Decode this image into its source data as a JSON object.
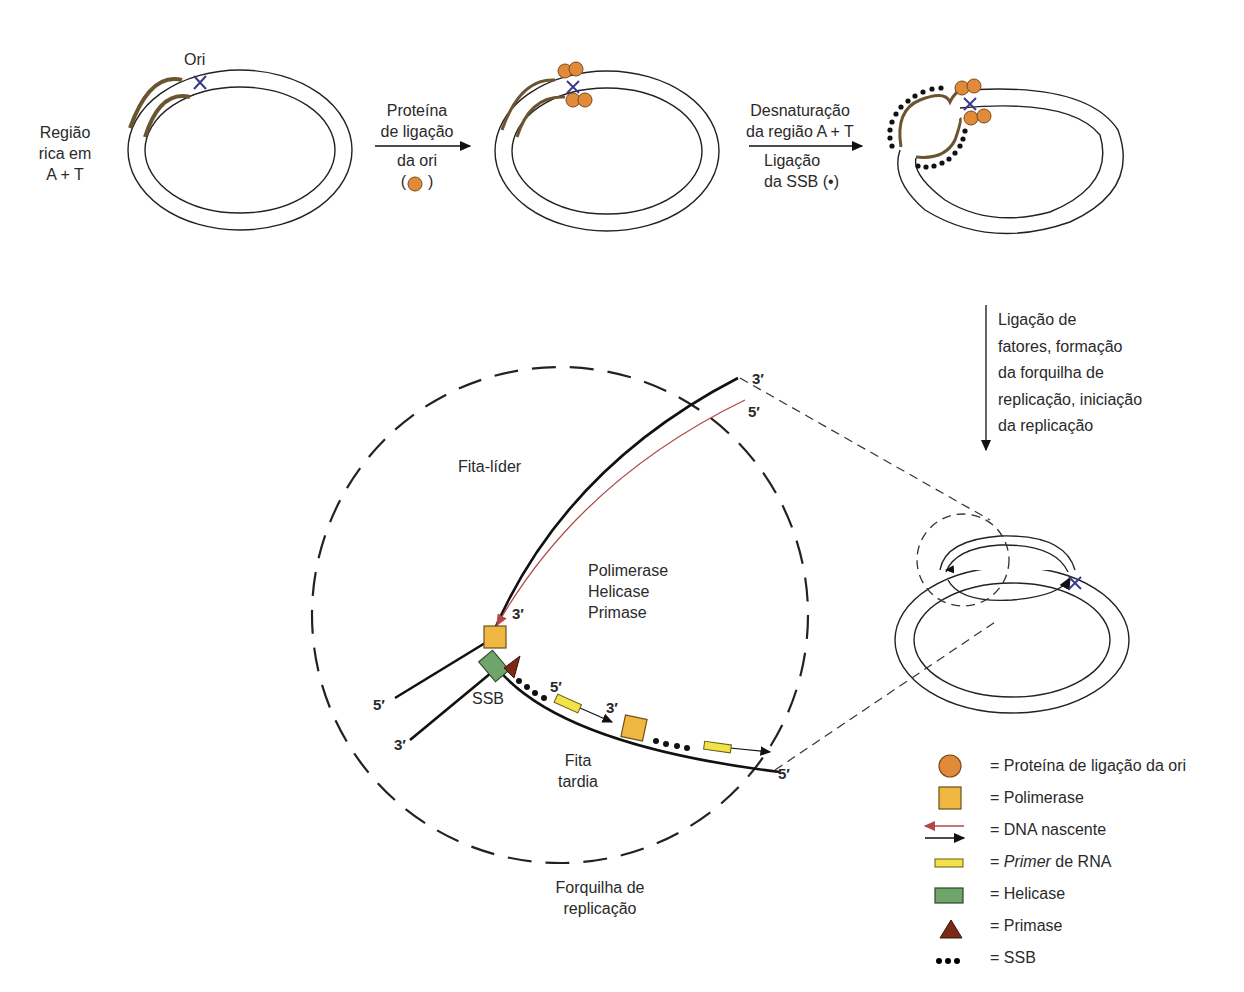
{
  "top_row": {
    "at_region_label_l1": "Região",
    "at_region_label_l2": "rica em",
    "at_region_label_l3": "A + T",
    "ori_label": "Ori",
    "step1": {
      "line1": "Proteína",
      "line2": "de ligação",
      "line3": "da ori",
      "line4_open": "(",
      "line4_close": ")"
    },
    "step2": {
      "line1": "Desnaturação",
      "line2": "da região A + T",
      "line3": "Ligação",
      "line4": "da SSB (•)"
    }
  },
  "step3": {
    "line1": "Ligação de",
    "line2": "fatores, formação",
    "line3": "da forquilha de",
    "line4": "replicação, iniciação",
    "line5": "da replicação"
  },
  "fork": {
    "leading_strand_label": "Fita-líder",
    "enzymes_l1": "Polimerase",
    "enzymes_l2": "Helicase",
    "enzymes_l3": "Primase",
    "ssb_label": "SSB",
    "lagging_l1": "Fita",
    "lagging_l2": "tardia",
    "fork_caption_l1": "Forquilha de",
    "fork_caption_l2": "replicação",
    "end_labels": {
      "top_3": "3′",
      "top_5": "5′",
      "leading_3": "3′",
      "left_5": "5′",
      "left_3": "3′",
      "okazaki_5": "5′",
      "okazaki_3": "3′",
      "bottom_5": "5′"
    }
  },
  "legend": [
    {
      "symbol": "orange-circle",
      "text": "= Proteína de ligação da ori"
    },
    {
      "symbol": "yellow-square",
      "text": "= Polimerase"
    },
    {
      "symbol": "arrows",
      "text": "= DNA nascente"
    },
    {
      "symbol": "yellow-bar",
      "italic": "Primer",
      "text": " de RNA",
      "prefix": "= "
    },
    {
      "symbol": "green-rect",
      "text": "= Helicase"
    },
    {
      "symbol": "brown-triangle",
      "text": "= Primase"
    },
    {
      "symbol": "dots",
      "text": "= SSB"
    }
  ],
  "colors": {
    "ori_protein": "#e08a3a",
    "polymerase": "#f0b840",
    "primer": "#f2e24a",
    "helicase": "#6fa56a",
    "primase": "#7a2a14",
    "nascent_dna": "#b04848",
    "at_region": "#6b5530",
    "ori_cross": "#3a3a8a"
  }
}
